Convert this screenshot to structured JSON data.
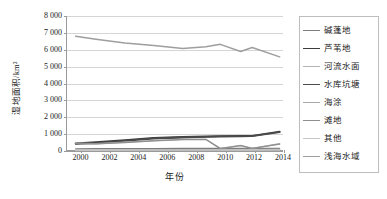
{
  "chart_data": {
    "type": "line",
    "title": "",
    "xlabel": "年份",
    "ylabel": "湿地面积/km²",
    "grid": true,
    "legend_position": "right",
    "xlim": [
      1999,
      2014
    ],
    "ylim": [
      0,
      8000
    ],
    "ytick_labels": [
      "8 000",
      "7 000",
      "6 000",
      "5 000",
      "4 000",
      "3 000",
      "2 000",
      "1 000",
      "0"
    ],
    "ytick_values": [
      8000,
      7000,
      6000,
      5000,
      4000,
      3000,
      2000,
      1000,
      0
    ],
    "xtick_labels": [
      "2000",
      "2002",
      "2004",
      "2006",
      "2008",
      "2010",
      "2012",
      "2014"
    ],
    "xtick_values": [
      2000,
      2002,
      2004,
      2006,
      2008,
      2010,
      2012,
      2014
    ],
    "x": [
      1999.6,
      2001,
      2003,
      2005,
      2007,
      2008.6,
      2009.6,
      2011,
      2011.8,
      2013.7
    ],
    "series": [
      {
        "name": "碱蓬地",
        "color": "#7d7d7d",
        "width": 1.3,
        "values": [
          130,
          135,
          140,
          145,
          150,
          150,
          150,
          155,
          155,
          160
        ]
      },
      {
        "name": "芦苇地",
        "color": "#3c3c3c",
        "width": 1.8,
        "values": [
          450,
          520,
          650,
          780,
          830,
          860,
          880,
          890,
          900,
          1150
        ]
      },
      {
        "name": "河流水面",
        "color": "#b5b5b5",
        "width": 1.3,
        "values": [
          60,
          65,
          70,
          75,
          80,
          80,
          80,
          85,
          85,
          90
        ]
      },
      {
        "name": "水库坑塘",
        "color": "#4a4a4a",
        "width": 1.8,
        "values": [
          430,
          470,
          600,
          740,
          800,
          840,
          860,
          875,
          885,
          1120
        ]
      },
      {
        "name": "海涂",
        "color": "#a8a8a8",
        "width": 1.3,
        "values": [
          470,
          430,
          520,
          620,
          690,
          700,
          150,
          330,
          160,
          430
        ]
      },
      {
        "name": "滩地",
        "color": "#8f8f8f",
        "width": 1.3,
        "values": [
          455,
          420,
          505,
          600,
          670,
          680,
          140,
          315,
          150,
          410
        ]
      },
      {
        "name": "其他",
        "color": "#c6c6c6",
        "width": 1.3,
        "values": [
          40,
          45,
          50,
          55,
          55,
          55,
          55,
          60,
          60,
          65
        ]
      },
      {
        "name": "浅海水域",
        "color": "#9e9e9e",
        "width": 1.5,
        "values": [
          6800,
          6620,
          6400,
          6250,
          6080,
          6180,
          6320,
          5900,
          6130,
          5580
        ]
      }
    ]
  }
}
